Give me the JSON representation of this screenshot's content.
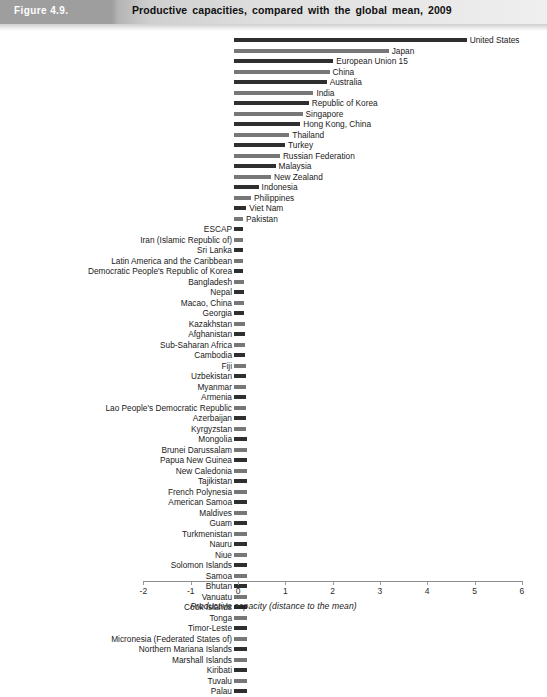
{
  "header": {
    "figure_number": "Figure 4.9.",
    "title": "Productive capacities, compared with the global mean, 2009"
  },
  "axis": {
    "title": "Productive capacity (distance to the mean)",
    "ticks": [
      "-2",
      "-1",
      "0",
      "1",
      "2",
      "3",
      "4",
      "5",
      "6"
    ]
  },
  "colors": {
    "bar_dark": "#2f2f2f",
    "bar_light": "#777777",
    "header_block": "#9e9e9e",
    "axis": "#8d8d8d"
  },
  "chart_data": {
    "type": "bar",
    "orientation": "horizontal",
    "title": "Productive capacities, compared with the global mean, 2009",
    "xlabel": "Productive capacity (distance to the mean)",
    "ylabel": "",
    "xlim": [
      -2,
      6
    ],
    "grid": false,
    "legend": "none",
    "categories": [
      "United States",
      "Japan",
      "European Union 15",
      "China",
      "Australia",
      "India",
      "Republic of Korea",
      "Singapore",
      "Hong Kong, China",
      "Thailand",
      "Turkey",
      "Russian Federation",
      "Malaysia",
      "New Zealand",
      "Indonesia",
      "Philippines",
      "Viet Nam",
      "Pakistan",
      "ESCAP",
      "Iran (Islamic Republic of)",
      "Sri Lanka",
      "Latin America and the Caribbean",
      "Democratic People's Republic of Korea",
      "Bangladesh",
      "Nepal",
      "Macao, China",
      "Georgia",
      "Kazakhstan",
      "Afghanistan",
      "Sub-Saharan Africa",
      "Cambodia",
      "Fiji",
      "Uzbekistan",
      "Myanmar",
      "Armenia",
      "Lao People's Democratic Republic",
      "Azerbaijan",
      "Kyrgyzstan",
      "Mongolia",
      "Brunei Darussalam",
      "Papua New Guinea",
      "New Caledonia",
      "Tajikistan",
      "French Polynesia",
      "American Samoa",
      "Maldives",
      "Guam",
      "Turkmenistan",
      "Nauru",
      "Niue",
      "Solomon Islands",
      "Samoa",
      "Bhutan",
      "Vanuatu",
      "Cook Islands",
      "Tonga",
      "Timor-Leste",
      "Micronesia (Federated States of)",
      "Northern Mariana Islands",
      "Marshall Islands",
      "Kiribati",
      "Tuvalu",
      "Palau"
    ],
    "values": [
      4.92,
      3.27,
      2.1,
      2.02,
      1.96,
      1.68,
      1.58,
      1.45,
      1.4,
      1.17,
      1.08,
      0.97,
      0.88,
      0.78,
      0.52,
      0.36,
      0.26,
      0.09,
      0.02,
      -0.02,
      -0.1,
      -0.15,
      -0.18,
      -0.21,
      -0.21,
      -0.22,
      -0.22,
      -0.23,
      -0.23,
      -0.24,
      -0.24,
      -0.25,
      -0.25,
      -0.25,
      -0.26,
      -0.26,
      -0.26,
      -0.26,
      -0.27,
      -0.27,
      -0.27,
      -0.27,
      -0.27,
      -0.27,
      -0.27,
      -0.27,
      -0.27,
      -0.27,
      -0.27,
      -0.27,
      -0.27,
      -0.27,
      -0.27,
      -0.27,
      -0.27,
      -0.27,
      -0.27,
      -0.27,
      -0.27,
      -0.27,
      -0.27,
      -0.27,
      -0.27
    ],
    "bar_shades": [
      "dark",
      "light",
      "dark",
      "light",
      "dark",
      "light",
      "dark",
      "light",
      "dark",
      "light",
      "dark",
      "light",
      "dark",
      "light",
      "dark",
      "light",
      "dark",
      "light",
      "dark",
      "light",
      "dark",
      "light",
      "dark",
      "light",
      "dark",
      "light",
      "dark",
      "light",
      "dark",
      "light",
      "dark",
      "light",
      "dark",
      "light",
      "dark",
      "light",
      "dark",
      "light",
      "dark",
      "light",
      "dark",
      "light",
      "dark",
      "light",
      "dark",
      "light",
      "dark",
      "light",
      "dark",
      "light",
      "dark",
      "light",
      "dark",
      "light",
      "dark",
      "light",
      "dark",
      "light",
      "dark",
      "light",
      "dark",
      "light",
      "dark"
    ],
    "label_side": [
      "right",
      "right",
      "right",
      "right",
      "right",
      "right",
      "right",
      "right",
      "right",
      "right",
      "right",
      "right",
      "right",
      "right",
      "right",
      "right",
      "right",
      "right",
      "left",
      "left",
      "left",
      "left",
      "left",
      "left",
      "left",
      "left",
      "left",
      "left",
      "left",
      "left",
      "left",
      "left",
      "left",
      "left",
      "left",
      "left",
      "left",
      "left",
      "left",
      "left",
      "left",
      "left",
      "left",
      "left",
      "left",
      "left",
      "left",
      "left",
      "left",
      "left",
      "left",
      "left",
      "left",
      "left",
      "left",
      "left",
      "left",
      "left",
      "left",
      "left",
      "left",
      "left",
      "left"
    ]
  }
}
